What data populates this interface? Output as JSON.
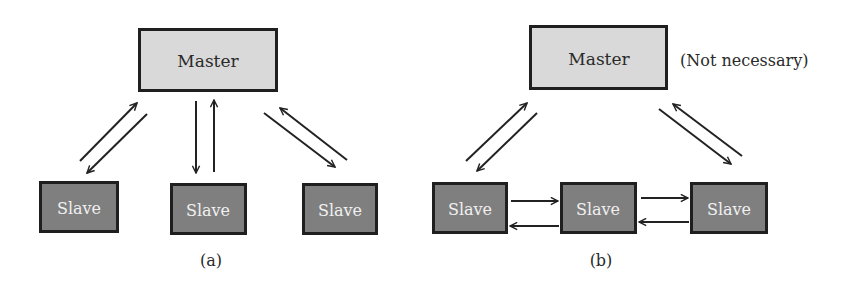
{
  "diagrams": [
    {
      "id": "a",
      "caption": "(a)",
      "master": {
        "label": "Master",
        "x": 138,
        "y": 28,
        "w": 140,
        "h": 64
      },
      "note": "",
      "slaves": [
        {
          "label": "Slave",
          "x": 39,
          "y": 181,
          "w": 80,
          "h": 52
        },
        {
          "label": "Slave",
          "x": 170,
          "y": 183,
          "w": 77,
          "h": 52
        },
        {
          "label": "Slave",
          "x": 302,
          "y": 183,
          "w": 76,
          "h": 52
        }
      ],
      "links": [
        {
          "from": "slave-1",
          "to": "master",
          "type": "bidirectional-pair"
        },
        {
          "from": "slave-2",
          "to": "master",
          "type": "bidirectional-pair"
        },
        {
          "from": "slave-3",
          "to": "master",
          "type": "bidirectional-pair"
        }
      ]
    },
    {
      "id": "b",
      "caption": "(b)",
      "master": {
        "label": "Master",
        "x": 529,
        "y": 25,
        "w": 139,
        "h": 65
      },
      "note": "(Not necessary)",
      "slaves": [
        {
          "label": "Slave",
          "x": 432,
          "y": 182,
          "w": 76,
          "h": 52
        },
        {
          "label": "Slave",
          "x": 560,
          "y": 182,
          "w": 77,
          "h": 52
        },
        {
          "label": "Slave",
          "x": 690,
          "y": 182,
          "w": 78,
          "h": 52
        }
      ],
      "links": [
        {
          "from": "slave-1",
          "to": "master",
          "type": "bidirectional-pair"
        },
        {
          "from": "slave-3",
          "to": "master",
          "type": "bidirectional-pair"
        },
        {
          "from": "slave-1",
          "to": "slave-2",
          "type": "bidirectional-pair"
        },
        {
          "from": "slave-2",
          "to": "slave-3",
          "type": "bidirectional-pair"
        }
      ]
    }
  ],
  "colors": {
    "master_fill": "#d9d9d9",
    "slave_fill": "#7f7f7f",
    "border": "#1f1f1f",
    "slave_text": "#f0f0f0",
    "master_text": "#2a2a2a",
    "arrow": "#222222"
  }
}
